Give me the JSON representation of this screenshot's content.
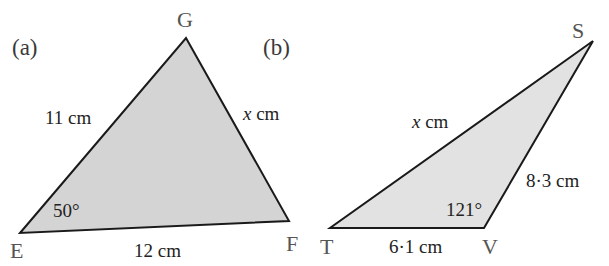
{
  "figure_a": {
    "label": "(a)",
    "vertices": {
      "E": "E",
      "G": "G",
      "F": "F"
    },
    "sides": {
      "EG": "11 cm",
      "GF_var": "x",
      "GF_unit": " cm",
      "EF": "12 cm"
    },
    "angle_E": "50°",
    "fill": "#d4d4d4",
    "stroke": "#1a1a1a"
  },
  "figure_b": {
    "label": "(b)",
    "vertices": {
      "T": "T",
      "V": "V",
      "S": "S"
    },
    "sides": {
      "TS_var": "x",
      "TS_unit": " cm",
      "VS": "8·3 cm",
      "TV": "6·1 cm"
    },
    "angle_V": "121°",
    "fill": "#e2e2e2",
    "stroke": "#1a1a1a"
  }
}
